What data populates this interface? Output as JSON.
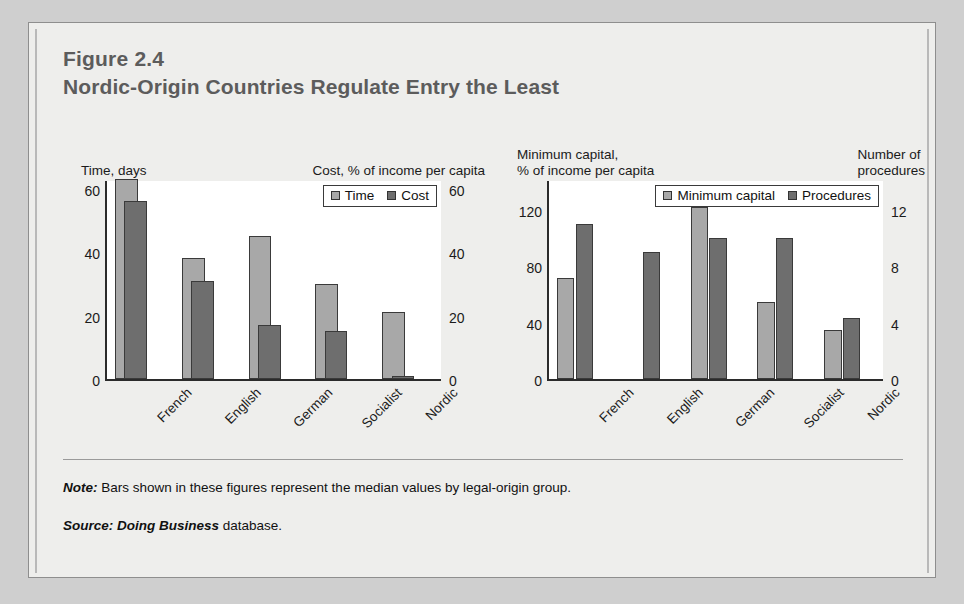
{
  "figure": {
    "number": "Figure 2.4",
    "title": "Nordic-Origin Countries Regulate Entry the Least"
  },
  "footer": {
    "note_label": "Note:",
    "note_text": " Bars shown in these figures represent the median values by legal-origin group.",
    "source_label": "Source:",
    "source_emphasis": " Doing Business",
    "source_text": " database."
  },
  "chart_data": [
    {
      "type": "bar",
      "id": "entry-time-cost",
      "title": "",
      "categories": [
        "French",
        "English",
        "German",
        "Socialist",
        "Nordic"
      ],
      "series": [
        {
          "name": "Time",
          "axis": "left",
          "values": [
            63,
            38,
            45,
            30,
            21
          ]
        },
        {
          "name": "Cost",
          "axis": "right",
          "values": [
            56,
            31,
            17,
            15,
            1
          ]
        }
      ],
      "left_axis": {
        "label": "Time, days",
        "ticks": [
          0,
          20,
          40,
          60
        ],
        "ylim": [
          0,
          63
        ]
      },
      "right_axis": {
        "label": "Cost, % of income per capita",
        "ticks": [
          0,
          20,
          40,
          60
        ],
        "ylim": [
          0,
          63
        ]
      },
      "legend": [
        "Time",
        "Cost"
      ],
      "legend_position": "top-right",
      "grid": false,
      "bar_style": "overlapping"
    },
    {
      "type": "bar",
      "id": "entry-capital-procedures",
      "title": "",
      "categories": [
        "French",
        "English",
        "German",
        "Socialist",
        "Nordic"
      ],
      "series": [
        {
          "name": "Minimum capital",
          "axis": "left",
          "values": [
            72,
            0,
            122,
            55,
            35
          ]
        },
        {
          "name": "Procedures",
          "axis": "right",
          "values": [
            11,
            9,
            10,
            10,
            4.3
          ]
        }
      ],
      "left_axis": {
        "label": "Minimum capital,\n% of income per capita",
        "ticks": [
          0,
          40,
          80,
          120
        ],
        "ylim": [
          0,
          142
        ]
      },
      "right_axis": {
        "label": "Number of\nprocedures",
        "ticks": [
          0,
          4,
          8,
          12
        ],
        "ylim": [
          0,
          14.2
        ]
      },
      "legend": [
        "Minimum capital",
        "Procedures"
      ],
      "legend_position": "top-right",
      "grid": false,
      "bar_style": "grouped"
    }
  ],
  "colors": {
    "light_series": "#a8a8a8",
    "dark_series": "#6e6e6e",
    "card_background": "#eeeeec",
    "page_background": "#cfcfcf",
    "axis": "#2b2b2b"
  }
}
